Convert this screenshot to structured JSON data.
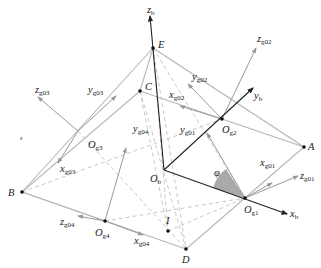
{
  "diagram": {
    "title": "",
    "points": {
      "E": {
        "label": "E"
      },
      "C": {
        "label": "C"
      },
      "A": {
        "label": "A"
      },
      "B": {
        "label": "B"
      },
      "D": {
        "label": "D"
      },
      "I": {
        "label": "I"
      },
      "Ob": {
        "label": "O",
        "sub": "b"
      },
      "Og1": {
        "label": "O",
        "sub": "g1"
      },
      "Og2": {
        "label": "O",
        "sub": "g2"
      },
      "Og3": {
        "label": "O",
        "sub": "g3"
      },
      "Og4": {
        "label": "O",
        "sub": "g4"
      }
    },
    "axes": {
      "zb": {
        "label": "z",
        "sub": "b"
      },
      "yb": {
        "label": "y",
        "sub": "b"
      },
      "xb": {
        "label": "x",
        "sub": "b"
      },
      "zg01": {
        "label": "z",
        "sub": "g01"
      },
      "xg01": {
        "label": "x",
        "sub": "g01"
      },
      "yg01": {
        "label": "y",
        "sub": "g01"
      },
      "zg02": {
        "label": "z",
        "sub": "g02"
      },
      "yg02": {
        "label": "y",
        "sub": "g02"
      },
      "xg02": {
        "label": "x",
        "sub": "g02"
      },
      "zg03": {
        "label": "z",
        "sub": "g03"
      },
      "yg03": {
        "label": "y",
        "sub": "g03"
      },
      "xg03": {
        "label": "x",
        "sub": "g03"
      },
      "zg04": {
        "label": "z",
        "sub": "g04"
      },
      "yg04": {
        "label": "y",
        "sub": "g04"
      },
      "xg04": {
        "label": "x",
        "sub": "g04"
      }
    },
    "angle": {
      "label": "φ",
      "fill": "#a9a9a9"
    },
    "stray_mark": "s",
    "colors": {
      "main_axis": "#222222",
      "frame_line": "#b8b8b8",
      "dashed_line": "#c8c8c8",
      "angle_fill": "#a9a9a9"
    }
  }
}
